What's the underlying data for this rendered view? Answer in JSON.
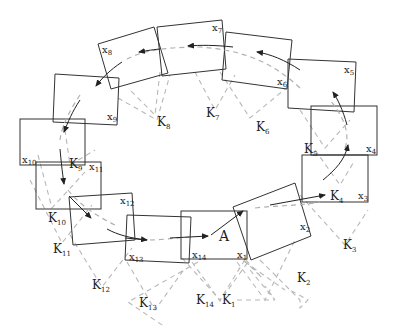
{
  "diagram": {
    "start_label": "A",
    "colors": {
      "frame_stroke": "#333333",
      "keyframe_link": "#b8b8b8",
      "path_dashed": "#b0b0b0",
      "arrow": "#222222"
    },
    "frames": [
      {
        "id": "x1",
        "base": "x",
        "sub": "1"
      },
      {
        "id": "x2",
        "base": "x",
        "sub": "2"
      },
      {
        "id": "x3",
        "base": "x",
        "sub": "3"
      },
      {
        "id": "x4",
        "base": "x",
        "sub": "4"
      },
      {
        "id": "x5",
        "base": "x",
        "sub": "5"
      },
      {
        "id": "x6",
        "base": "x",
        "sub": "6"
      },
      {
        "id": "x7",
        "base": "x",
        "sub": "7"
      },
      {
        "id": "x8",
        "base": "x",
        "sub": "8"
      },
      {
        "id": "x9",
        "base": "x",
        "sub": "9"
      },
      {
        "id": "x10",
        "base": "x",
        "sub": "10"
      },
      {
        "id": "x11",
        "base": "x",
        "sub": "11"
      },
      {
        "id": "x12",
        "base": "x",
        "sub": "12"
      },
      {
        "id": "x13",
        "base": "x",
        "sub": "13"
      },
      {
        "id": "x14",
        "base": "x",
        "sub": "14"
      }
    ],
    "keyframes": [
      {
        "id": "k1",
        "base": "K",
        "sub": "1"
      },
      {
        "id": "k2",
        "base": "K",
        "sub": "2"
      },
      {
        "id": "k3",
        "base": "K",
        "sub": "3"
      },
      {
        "id": "k4",
        "base": "K",
        "sub": "4"
      },
      {
        "id": "k5",
        "base": "K",
        "sub": "5"
      },
      {
        "id": "k6",
        "base": "K",
        "sub": "6"
      },
      {
        "id": "k7",
        "base": "K",
        "sub": "7"
      },
      {
        "id": "k8",
        "base": "K",
        "sub": "8"
      },
      {
        "id": "k9",
        "base": "K",
        "sub": "9"
      },
      {
        "id": "k10",
        "base": "K",
        "sub": "10"
      },
      {
        "id": "k11",
        "base": "K",
        "sub": "11"
      },
      {
        "id": "k12",
        "base": "K",
        "sub": "12"
      },
      {
        "id": "k13",
        "base": "K",
        "sub": "13"
      },
      {
        "id": "k14",
        "base": "K",
        "sub": "14"
      }
    ]
  }
}
